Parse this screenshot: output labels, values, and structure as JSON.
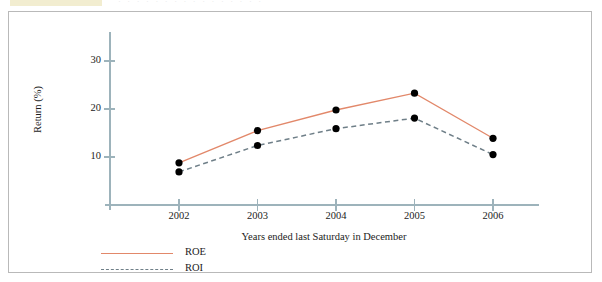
{
  "top_strip": {
    "ghost_text": "·  ·      ·   ·   ·          ·  ·  ·    ·   ·  ·      ·   ·   ·  ·  ·"
  },
  "chart_data": {
    "type": "line",
    "title": "",
    "subtitle": "",
    "xlabel": "Years ended last Saturday in December",
    "ylabel": "Return (%)",
    "categories": [
      "2002",
      "2003",
      "2004",
      "2005",
      "2006"
    ],
    "x_tick_labels": [
      "2002",
      "2003",
      "2004",
      "2005",
      "2006"
    ],
    "y_tick_labels": [
      "10",
      "20",
      "30"
    ],
    "y_ticks": [
      10,
      20,
      30
    ],
    "ylim": [
      0,
      33
    ],
    "grid": false,
    "legend_position": "below-left",
    "markers": "filled-circle",
    "series": [
      {
        "name": "ROE",
        "label": "ROE",
        "color": "#e2886a",
        "style": "solid",
        "values": [
          8.8,
          15.5,
          19.8,
          23.3,
          13.9
        ]
      },
      {
        "name": "ROI",
        "label": "ROI",
        "color": "#6f7f88",
        "style": "dashed",
        "values": [
          6.9,
          12.4,
          15.9,
          18.1,
          10.5
        ]
      }
    ],
    "axis_color": "#9db3bb",
    "marker_color": "#000000"
  }
}
